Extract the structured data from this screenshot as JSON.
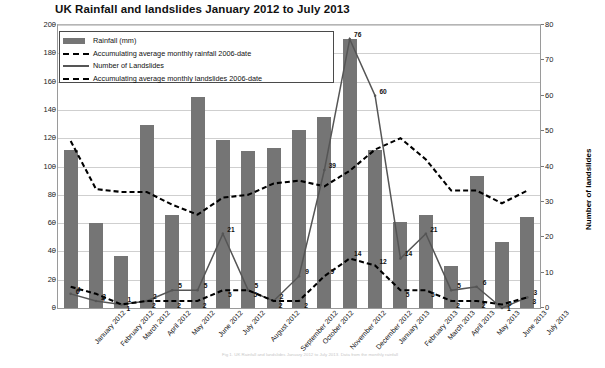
{
  "chart_data": {
    "type": "bar",
    "title": "UK Rainfall and landslides January 2012 to July 2013",
    "xlabel": "",
    "ylabel": "Rainfall in mm",
    "ylabel_secondary": "Number of landslides",
    "ylim": [
      0,
      200
    ],
    "ylim_secondary": [
      0,
      80
    ],
    "yticks": [
      0,
      20,
      40,
      60,
      80,
      100,
      120,
      140,
      160,
      180,
      200
    ],
    "yticks_secondary": [
      0,
      10,
      20,
      30,
      40,
      50,
      60,
      70,
      80
    ],
    "grid": true,
    "legend_position": "upper-left",
    "categories": [
      "January 2012",
      "February 2012",
      "March 2012",
      "April 2012",
      "May 2012",
      "June 2012",
      "July 2012",
      "August 2012",
      "September 2012",
      "October 2012",
      "November 2012",
      "December 2012",
      "January 2013",
      "February 2013",
      "March 2013",
      "April 2013",
      "May 2013",
      "June 2013",
      "July 2013"
    ],
    "series": [
      {
        "name": "Rainfall (mm)",
        "type": "bar",
        "axis": "left",
        "color": "#757575",
        "values": [
          112,
          60,
          37,
          129,
          66,
          149,
          119,
          111,
          113,
          126,
          135,
          190,
          112,
          61,
          66,
          30,
          93,
          47,
          64
        ]
      },
      {
        "name": "Accumulating average monthly rainfall 2006-date",
        "type": "line-dashed",
        "axis": "left",
        "color": "#000000",
        "values": [
          118,
          84,
          82,
          82,
          73,
          66,
          78,
          80,
          88,
          90,
          86,
          97,
          112,
          120,
          105,
          83,
          83,
          74,
          83
        ]
      },
      {
        "name": "Number of Landslides",
        "type": "line-solid",
        "axis": "right",
        "color": "#555555",
        "values": [
          4,
          2,
          1,
          2,
          5,
          5,
          21,
          5,
          2,
          9,
          39,
          76,
          60,
          14,
          21,
          5,
          6,
          0,
          3
        ]
      },
      {
        "name": "Accumulating average monthly landslides 2006-date",
        "type": "line-dashed",
        "axis": "right",
        "color": "#000000",
        "values": [
          6,
          4,
          1,
          2,
          2,
          2,
          5,
          5,
          2,
          2,
          9,
          14,
          12,
          5,
          5,
          2,
          2,
          1,
          3
        ]
      }
    ],
    "data_labels": {
      "landslides": [
        4,
        2,
        1,
        2,
        5,
        5,
        21,
        5,
        2,
        9,
        39,
        76,
        60,
        14,
        21,
        5,
        6,
        0,
        3
      ],
      "landslides_avg": [
        6,
        4,
        1,
        2,
        2,
        2,
        5,
        5,
        2,
        2,
        9,
        14,
        12,
        5,
        5,
        2,
        2,
        1,
        3
      ]
    }
  },
  "legend": {
    "items": [
      {
        "label": "Rainfall (mm)",
        "key": "bar-swatch"
      },
      {
        "label": "Accumulating average monthly rainfall 2006-date",
        "key": "dashed-line"
      },
      {
        "label": "Number of Landslides",
        "key": "solid-line"
      },
      {
        "label": "Accumulating average monthly landslides 2006-date",
        "key": "dashed-line"
      }
    ]
  },
  "caption": "Fig 1. UK Rainfall and landslides January 2012 to July 2013. Data from the monthly rainfall"
}
